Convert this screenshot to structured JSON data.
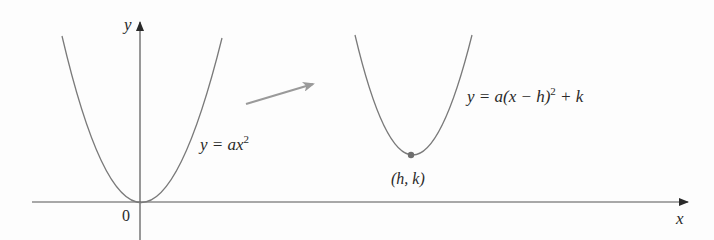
{
  "diagram": {
    "axes": {
      "x_label": "x",
      "y_label": "y",
      "origin_label": "0"
    },
    "curves": [
      {
        "name": "standard-parabola",
        "equation_lhs": "y = ax",
        "equation_exp": "2",
        "vertex": "origin"
      },
      {
        "name": "shifted-parabola",
        "equation_prefix": "y = a(x − h)",
        "equation_exp": "2",
        "equation_suffix": " + k",
        "vertex_label": "(h, k)"
      }
    ],
    "arrow": {
      "meaning": "shift",
      "color": "#9a9a9a"
    },
    "colors": {
      "curve": "#7a7a7a",
      "axis": "#555555",
      "vertex_dot": "#6e6e6e",
      "text": "#2a2a2a"
    }
  }
}
